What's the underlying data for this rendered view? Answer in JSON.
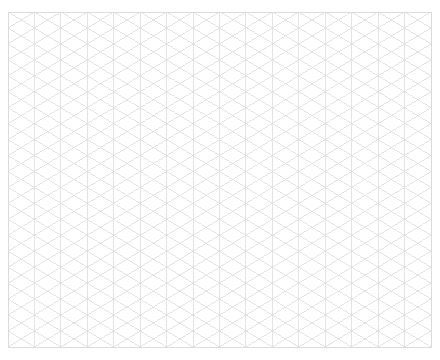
{
  "page": {
    "background_color": "#ffffff",
    "width": 440,
    "height": 360
  },
  "grid": {
    "name": "isometric-triangular-grid",
    "line_color": "#dcdcdc",
    "border_color": "#d8d8d8",
    "line_width": 0.8,
    "border_width": 0.9,
    "origin_x": 8,
    "origin_y": 12,
    "area_width": 423,
    "area_height": 335,
    "column_spacing": 26.4375,
    "row_spacing": 15.95,
    "columns": 16,
    "rows": 21,
    "vertical_lines": 17,
    "diagonal_angle_degrees": 31.1,
    "families": [
      "vertical",
      "diagonal-down-right",
      "diagonal-up-right"
    ]
  }
}
